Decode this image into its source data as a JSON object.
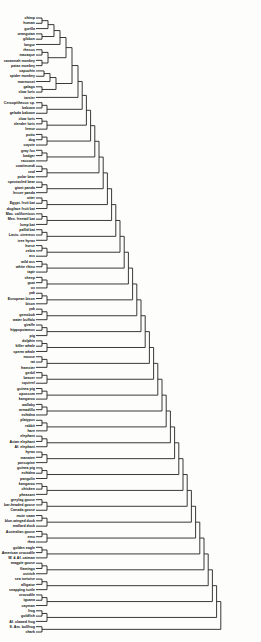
{
  "diagram": {
    "type": "dendrogram",
    "orientation": "leaves-left-root-right",
    "line_color": "#222222",
    "background": "#fdfdfb",
    "leaves": [
      "chimp",
      "human",
      "gorilla",
      "orangutan",
      "gibbon",
      "langur",
      "rhesus",
      "macaque",
      "savannah monkey",
      "patas monkey",
      "capuchin",
      "spider monkey",
      "marmoset",
      "galago",
      "slow loris",
      "tarsier",
      "Cercopithecus sp.",
      "baboon",
      "gelada baboon",
      "slow loris",
      "slender loris",
      "lemur",
      "potto",
      "dog",
      "coyote",
      "gray fox",
      "badger",
      "raccoon",
      "coatimundi",
      "seal",
      "polar bear",
      "spectacled bear",
      "giant panda",
      "lesser panda",
      "otter",
      "Egypt. fruit bat",
      "dogface fruit bat",
      "Mac. californicus",
      "Mex. freetail bat",
      "lump bat",
      "pallid bat",
      "Lasiu. cinereus",
      "tree hyrax",
      "horse",
      "zebra",
      "ass",
      "wild ass",
      "white rhino",
      "tapir",
      "sheep",
      "goat",
      "ox",
      "yak",
      "European bison",
      "bison",
      "yak",
      "gemsbok",
      "water buffalo",
      "giraffe",
      "hippopotamus",
      "pig",
      "dolphin",
      "killer whale",
      "sperm whale",
      "mouse",
      "rat",
      "hamster",
      "gerbil",
      "beaver",
      "squirrel",
      "guinea pig",
      "opossum",
      "kangaroo",
      "wallaby",
      "armadillo",
      "echidna",
      "platypus",
      "rabbit",
      "hare",
      "elephant",
      "Asian elephant",
      "Af. elephant",
      "hyrax",
      "manatee",
      "porcupine",
      "guinea pig",
      "echidna",
      "pangolin",
      "kangaroo",
      "chicken",
      "pheasant",
      "greylag goose",
      "bar-headed goose",
      "Canada goose",
      "mute swan",
      "blue-winged duck",
      "mallard duck",
      "Australian goose",
      "emu",
      "rhea",
      "golden eagle",
      "American crocodile",
      "W. & Af. caiman",
      "magpie goose",
      "flamingo",
      "ostrich",
      "sea tortoise",
      "alligator",
      "snapping turtle",
      "crocodile",
      "iguana",
      "cayman",
      "frog",
      "goldfish",
      "Af. clawed frog",
      "S. Am. bullfrog",
      "shark"
    ],
    "clusters": [
      {
        "id": "c0",
        "children": [
          "L0",
          "L1"
        ],
        "height": 6
      },
      {
        "id": "c1",
        "children": [
          "c0",
          "L2"
        ],
        "height": 12
      },
      {
        "id": "c2",
        "children": [
          "L3",
          "L4"
        ],
        "height": 6
      },
      {
        "id": "c3",
        "children": [
          "c1",
          "c2"
        ],
        "height": 18
      },
      {
        "id": "c4",
        "children": [
          "c3",
          "L5"
        ],
        "height": 24
      },
      {
        "id": "c5",
        "children": [
          "L6",
          "L7"
        ],
        "height": 6
      },
      {
        "id": "c6",
        "children": [
          "L8",
          "L9"
        ],
        "height": 6
      },
      {
        "id": "c7",
        "children": [
          "c5",
          "c6"
        ],
        "height": 12
      },
      {
        "id": "c8",
        "children": [
          "c4",
          "c7"
        ],
        "height": 30
      },
      {
        "id": "c9",
        "children": [
          "L10",
          "L11"
        ],
        "height": 8
      },
      {
        "id": "c10",
        "children": [
          "c9",
          "L12"
        ],
        "height": 14
      },
      {
        "id": "c11",
        "children": [
          "L13",
          "L14"
        ],
        "height": 6
      },
      {
        "id": "c12",
        "children": [
          "c10",
          "c11"
        ],
        "height": 20
      },
      {
        "id": "c13",
        "children": [
          "c8",
          "c12"
        ],
        "height": 36
      },
      {
        "id": "c14",
        "children": [
          "c13",
          "L15"
        ],
        "height": 42
      }
    ]
  }
}
